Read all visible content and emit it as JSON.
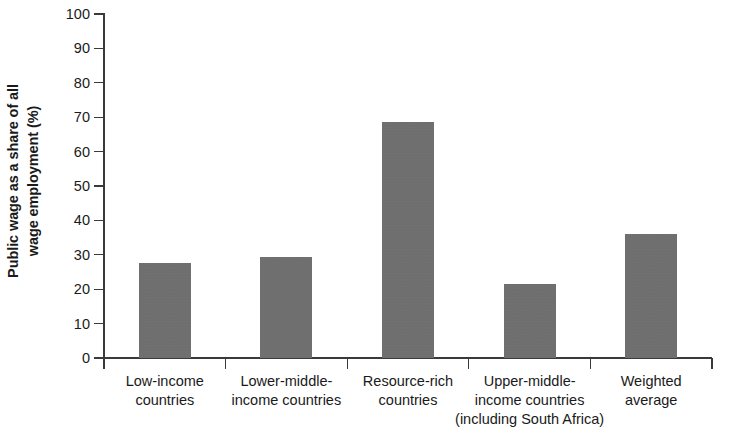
{
  "chart_data": {
    "type": "bar",
    "title": "",
    "subtitle": "",
    "xlabel": "",
    "ylabel": "Public wage as a share of all wage employment (%)",
    "ylabel_lines": [
      "Public wage as a share of all",
      "wage employment (%)"
    ],
    "categories": [
      "Low-income countries",
      "Lower-middle-income countries",
      "Resource-rich countries",
      "Upper-middle-income countries (including South Africa)",
      "Weighted average"
    ],
    "category_label_lines": [
      [
        "Low-income",
        "countries"
      ],
      [
        "Lower-middle-",
        "income countries"
      ],
      [
        "Resource-rich",
        "countries"
      ],
      [
        "Upper-middle-",
        "income countries",
        "(including South Africa)"
      ],
      [
        "Weighted",
        "average"
      ]
    ],
    "values": [
      27.5,
      29.5,
      68.5,
      21.5,
      36.0
    ],
    "ylim": [
      0,
      100
    ],
    "ytick_labels": [
      "100",
      "90",
      "80",
      "70",
      "60",
      "50",
      "40",
      "30",
      "20",
      "10",
      "0"
    ],
    "ytick_values": [
      100,
      90,
      80,
      70,
      60,
      50,
      40,
      30,
      20,
      10,
      0
    ],
    "grid": false,
    "legend": null,
    "bar_color": "#6e6e6e",
    "axis_color": "#3a3a3a",
    "background_color": "#ffffff"
  }
}
